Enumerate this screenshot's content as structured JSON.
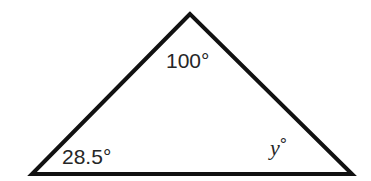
{
  "diagram": {
    "type": "triangle",
    "stroke_color": "#111111",
    "background": "#ffffff",
    "vertices": {
      "top": {
        "x": 190,
        "y": 14
      },
      "bottom_left": {
        "x": 32,
        "y": 174
      },
      "bottom_right": {
        "x": 352,
        "y": 174
      }
    },
    "angles": {
      "top": {
        "value": "100",
        "unit": "°"
      },
      "bottom_left": {
        "value": "28.5",
        "unit": "°"
      },
      "bottom_right": {
        "value": "y",
        "unit": "°",
        "is_variable": true
      }
    }
  }
}
